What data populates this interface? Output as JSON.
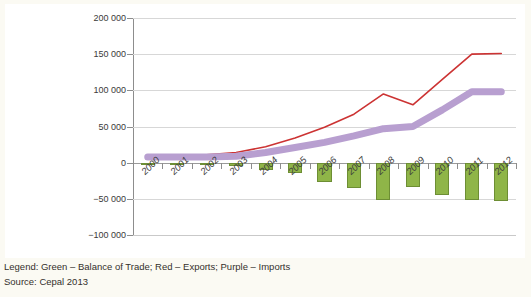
{
  "chart_data": {
    "type": "line",
    "title": "",
    "subtitle": "",
    "xlabel": "",
    "ylabel": "",
    "categories": [
      "2000",
      "2001",
      "2002",
      "2003",
      "2004",
      "2005",
      "2006",
      "2007",
      "2008",
      "2009",
      "2010",
      "2011",
      "2012"
    ],
    "ylim": [
      -100000,
      200000
    ],
    "ytick_labels": [
      "200 000",
      "150 000",
      "100 000",
      "50 000",
      "0",
      "−50 000",
      "−100 000"
    ],
    "ytick_values": [
      200000,
      150000,
      100000,
      50000,
      0,
      -50000,
      -100000
    ],
    "grid": true,
    "legend_position": "caption-below",
    "series": [
      {
        "name": "Exports",
        "key": "exports",
        "type": "line",
        "color": "#cc3333",
        "legend_label": "Red – Exports",
        "values": [
          10000,
          10000,
          11000,
          14000,
          22000,
          34000,
          49000,
          67000,
          95000,
          80000,
          115000,
          150000,
          151000
        ]
      },
      {
        "name": "Imports",
        "key": "imports",
        "type": "line",
        "color": "#b89fd0",
        "legend_label": "Purple – Imports",
        "values": [
          8000,
          8000,
          8000,
          9000,
          14000,
          21000,
          28000,
          37000,
          47000,
          50000,
          73000,
          98000,
          98000
        ]
      },
      {
        "name": "Balance of Trade",
        "key": "balance",
        "type": "bar",
        "color": "#8fb548",
        "border_color": "#6d8e34",
        "legend_label": "Green – Balance of Trade",
        "values": [
          -3000,
          -3000,
          -3500,
          -4000,
          -10000,
          -14000,
          -27000,
          -35000,
          -52000,
          -33000,
          -45000,
          -52000,
          -53000
        ]
      }
    ]
  },
  "caption": {
    "legend_line": "Legend: Green – Balance of Trade; Red – Exports; Purple – Imports",
    "source_line": "Source: Cepal 2013"
  },
  "colors": {
    "background": "#fbfaf3",
    "plot_background": "#ffffff",
    "grid": "#d7d7d7",
    "axis": "#8d8d8d",
    "text": "#3a3a3a",
    "exports": "#cc3333",
    "imports": "#b89fd0",
    "balance": "#8fb548",
    "balance_border": "#6d8e34"
  }
}
